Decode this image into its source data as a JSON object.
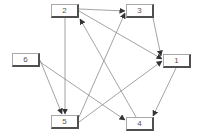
{
  "diagram": {
    "type": "directed-graph",
    "nodes": [
      {
        "id": "1",
        "label": "1",
        "x": 163,
        "y": 54
      },
      {
        "id": "2",
        "label": "2",
        "x": 51,
        "y": 4
      },
      {
        "id": "3",
        "label": "3",
        "x": 126,
        "y": 4
      },
      {
        "id": "4",
        "label": "4",
        "x": 126,
        "y": 117
      },
      {
        "id": "5",
        "label": "5",
        "x": 51,
        "y": 115
      },
      {
        "id": "6",
        "label": "6",
        "x": 12,
        "y": 53
      }
    ],
    "edges": [
      {
        "from": "2",
        "to": "3",
        "x1": 79,
        "y1": 9,
        "x2": 125,
        "y2": 11
      },
      {
        "from": "2",
        "to": "1",
        "x1": 79,
        "y1": 11,
        "x2": 162,
        "y2": 59
      },
      {
        "from": "2",
        "to": "5",
        "x1": 65,
        "y1": 18,
        "x2": 65,
        "y2": 114
      },
      {
        "from": "4",
        "to": "2",
        "x1": 136,
        "y1": 117,
        "x2": 80,
        "y2": 19
      },
      {
        "from": "3",
        "to": "1",
        "x1": 153,
        "y1": 18,
        "x2": 161,
        "y2": 56
      },
      {
        "from": "6",
        "to": "5",
        "x1": 40,
        "y1": 60,
        "x2": 62,
        "y2": 114
      },
      {
        "from": "6",
        "to": "4",
        "x1": 40,
        "y1": 62,
        "x2": 125,
        "y2": 120
      },
      {
        "from": "5",
        "to": "3",
        "x1": 79,
        "y1": 117,
        "x2": 125,
        "y2": 13
      },
      {
        "from": "5",
        "to": "1",
        "x1": 79,
        "y1": 122,
        "x2": 162,
        "y2": 61
      },
      {
        "from": "1",
        "to": "4",
        "x1": 176,
        "y1": 68,
        "x2": 153,
        "y2": 116
      }
    ],
    "colors": {
      "edge": "#8c8c8c",
      "arrow": "#333333",
      "node_border": "#a8a8a8",
      "node_shadow": "#505050",
      "label": "#555555"
    }
  }
}
